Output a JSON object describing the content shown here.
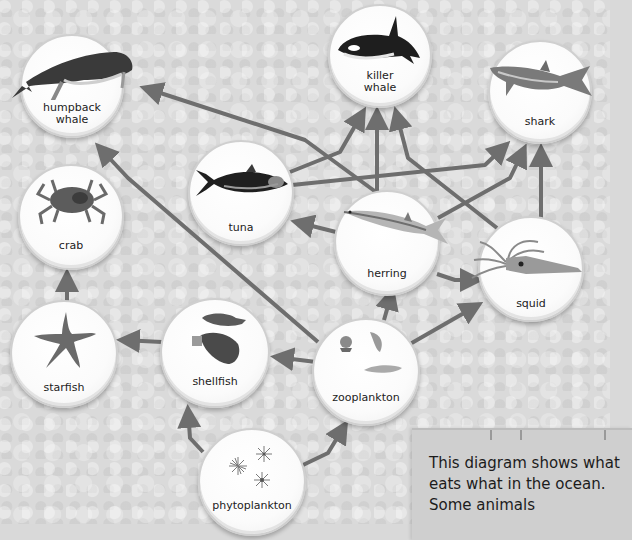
{
  "nodes": {
    "humpback_whale": {
      "label_line1": "humpback",
      "label_line2": "whale",
      "icon": "humpback-whale-icon"
    },
    "killer_whale": {
      "label_line1": "killer",
      "label_line2": "whale",
      "icon": "killer-whale-icon"
    },
    "shark": {
      "label": "shark",
      "icon": "shark-icon"
    },
    "crab": {
      "label": "crab",
      "icon": "crab-icon"
    },
    "tuna": {
      "label": "tuna",
      "icon": "tuna-icon"
    },
    "herring": {
      "label": "herring",
      "icon": "herring-icon"
    },
    "squid": {
      "label": "squid",
      "icon": "squid-icon"
    },
    "starfish": {
      "label": "starfish",
      "icon": "starfish-icon"
    },
    "shellfish": {
      "label": "shellfish",
      "icon": "shellfish-icon"
    },
    "zooplankton": {
      "label": "zooplankton",
      "icon": "zooplankton-icon"
    },
    "phytoplankton": {
      "label": "phytoplankton",
      "icon": "phytoplankton-icon"
    }
  },
  "edges": [
    {
      "from": "phytoplankton",
      "to": "shellfish"
    },
    {
      "from": "phytoplankton",
      "to": "zooplankton"
    },
    {
      "from": "zooplankton",
      "to": "shellfish"
    },
    {
      "from": "zooplankton",
      "to": "herring"
    },
    {
      "from": "zooplankton",
      "to": "squid"
    },
    {
      "from": "zooplankton",
      "to": "humpback_whale"
    },
    {
      "from": "shellfish",
      "to": "starfish"
    },
    {
      "from": "starfish",
      "to": "crab"
    },
    {
      "from": "herring",
      "to": "tuna"
    },
    {
      "from": "herring",
      "to": "squid"
    },
    {
      "from": "herring",
      "to": "killer_whale"
    },
    {
      "from": "herring",
      "to": "shark"
    },
    {
      "from": "herring",
      "to": "humpback_whale"
    },
    {
      "from": "tuna",
      "to": "killer_whale"
    },
    {
      "from": "tuna",
      "to": "shark"
    },
    {
      "from": "squid",
      "to": "killer_whale"
    },
    {
      "from": "squid",
      "to": "shark"
    }
  ],
  "caption": {
    "text": "This diagram shows what eats what in the ocean. Some animals"
  },
  "colors": {
    "arrow": "#6e6e6e",
    "node_fill": "#ffffff",
    "background": "#dadada"
  }
}
